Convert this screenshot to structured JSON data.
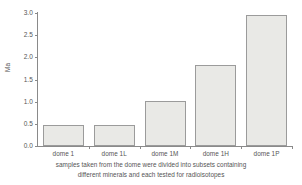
{
  "chart_data": {
    "type": "bar",
    "title": "",
    "subtitle": "",
    "xlabel": "",
    "ylabel": "Ma",
    "ylim": [
      0.0,
      3.0
    ],
    "grid": false,
    "legend": null,
    "categories": [
      "dome 1",
      "dome 1L",
      "dome 1M",
      "dome 1H",
      "dome 1P"
    ],
    "values": [
      0.47,
      0.48,
      1.02,
      1.83,
      2.96
    ],
    "ytick_labels": [
      "0.0",
      "0.5",
      "1.0",
      "1.5",
      "2.0",
      "2.5",
      "3.0"
    ],
    "ytick_values": [
      0.0,
      0.5,
      1.0,
      1.5,
      2.0,
      2.5,
      3.0
    ],
    "bar_fill_color": "#e9e9e6",
    "bar_border_color": "#9b9b9b",
    "axis_color": "#8a8a8a",
    "text_color": "#555555"
  },
  "caption": {
    "line1": "samples taken from the dome were divided into subsets containing",
    "line2": "different minerals and each tested for radioisotopes"
  }
}
